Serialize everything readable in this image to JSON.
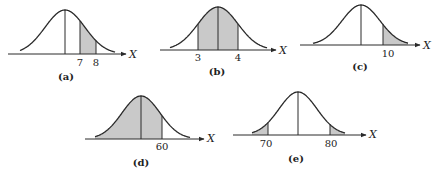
{
  "figure": {
    "axis_variable": "X",
    "shade_color": "#c9c9c9",
    "line_color": "#2a2a2a",
    "panels": [
      {
        "id": "a",
        "label": "(a)",
        "mean_x": 65,
        "sigma": 20,
        "base_y": 54,
        "peak_y": 10,
        "axis_x1": 8,
        "axis_x2": 126,
        "curve_x1": 20,
        "curve_x2": 115,
        "shade_ranges": [
          [
            80,
            96
          ]
        ],
        "extra_lines": [
          80,
          96
        ],
        "ticks": [
          {
            "x": 80,
            "text": "7"
          },
          {
            "x": 96,
            "text": "8"
          }
        ],
        "tick_y": 66,
        "axis_label_x": 129,
        "axis_label_y": 58,
        "panel_label_x": 66,
        "panel_label_y": 80
      },
      {
        "id": "b",
        "label": "(b)",
        "mean_x": 218,
        "sigma": 20,
        "base_y": 50,
        "peak_y": 7,
        "axis_x1": 160,
        "axis_x2": 276,
        "curve_x1": 170,
        "curve_x2": 267,
        "shade_ranges": [
          [
            198,
            238
          ]
        ],
        "extra_lines": [
          198,
          238
        ],
        "ticks": [
          {
            "x": 198,
            "text": "3"
          },
          {
            "x": 238,
            "text": "4"
          }
        ],
        "tick_y": 61,
        "axis_label_x": 279,
        "axis_label_y": 54,
        "panel_label_x": 217,
        "panel_label_y": 75
      },
      {
        "id": "c",
        "label": "(c)",
        "mean_x": 361,
        "sigma": 19,
        "base_y": 45,
        "peak_y": 5,
        "axis_x1": 300,
        "axis_x2": 420,
        "curve_x1": 313,
        "curve_x2": 408,
        "shade_ranges": [
          [
            383,
            408
          ]
        ],
        "extra_lines": [
          383
        ],
        "ticks": [
          {
            "x": 388,
            "text": "10"
          }
        ],
        "tick_y": 57,
        "axis_label_x": 423,
        "axis_label_y": 49,
        "panel_label_x": 360,
        "panel_label_y": 70
      },
      {
        "id": "d",
        "label": "(d)",
        "mean_x": 141,
        "sigma": 19,
        "base_y": 139,
        "peak_y": 96,
        "axis_x1": 85,
        "axis_x2": 204,
        "curve_x1": 95,
        "curve_x2": 190,
        "shade_ranges": [
          [
            95,
            162
          ]
        ],
        "extra_lines": [
          162
        ],
        "ticks": [
          {
            "x": 162,
            "text": "60"
          }
        ],
        "tick_y": 150,
        "axis_label_x": 207,
        "axis_label_y": 142,
        "panel_label_x": 141,
        "panel_label_y": 166
      },
      {
        "id": "e",
        "label": "(e)",
        "mean_x": 298,
        "sigma": 19,
        "base_y": 135,
        "peak_y": 92,
        "axis_x1": 233,
        "axis_x2": 366,
        "curve_x1": 252,
        "curve_x2": 345,
        "shade_ranges": [
          [
            252,
            268
          ],
          [
            330,
            345
          ]
        ],
        "extra_lines": [
          268,
          330
        ],
        "ticks": [
          {
            "x": 266,
            "text": "70"
          },
          {
            "x": 331,
            "text": "80"
          }
        ],
        "tick_y": 147,
        "axis_label_x": 369,
        "axis_label_y": 138,
        "panel_label_x": 296,
        "panel_label_y": 162
      }
    ]
  }
}
